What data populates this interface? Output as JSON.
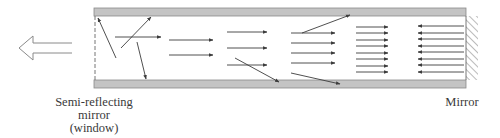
{
  "diagram": {
    "labels": {
      "window_line1": "Semi-reflecting",
      "window_line2": "mirror",
      "window_line3": "(window)",
      "mirror": "Mirror"
    },
    "colors": {
      "wall_fill": "#c4c4c4",
      "wall_stroke": "#8a8a8a",
      "arrow": "#3c3c3c",
      "text": "#3a3a3a"
    },
    "icons": {
      "output_arrow": "hollow-left-arrow-icon",
      "mirror_hatch": "hatched-mirror-icon"
    },
    "stages": [
      {
        "name": "stage-1-random",
        "arrows": 4,
        "direction": "mixed"
      },
      {
        "name": "stage-2",
        "arrows": 2,
        "direction": "right"
      },
      {
        "name": "stage-3",
        "arrows": 4,
        "direction": "right"
      },
      {
        "name": "stage-4",
        "arrows": 6,
        "direction": "right"
      },
      {
        "name": "stage-5",
        "arrows": 8,
        "direction": "right"
      },
      {
        "name": "stage-6-reflected",
        "arrows": 8,
        "direction": "left"
      }
    ]
  }
}
